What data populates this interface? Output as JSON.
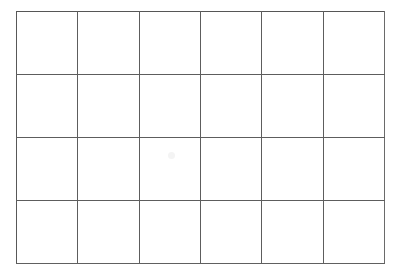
{
  "document": {
    "type": "empty-grid-table",
    "description": "Blank 6 column by 4 row grid / table with no content",
    "background_color": "#ffffff",
    "line_color": "#5d5d5d",
    "line_width_px": 1
  },
  "grid": {
    "columns": 6,
    "rows": 4,
    "total_cells": 24,
    "outer_left_px": 16,
    "outer_top_px": 11,
    "outer_width_px": 369,
    "outer_height_px": 253,
    "column_boundaries_px": [
      16,
      77,
      140,
      201,
      262,
      323,
      385
    ],
    "row_boundaries_px": [
      11,
      76,
      139,
      202,
      264
    ],
    "column_width_px": 61.5,
    "row_height_px": 63.25
  },
  "cells": [
    [
      "",
      "",
      "",
      "",
      "",
      ""
    ],
    [
      "",
      "",
      "",
      "",
      "",
      ""
    ],
    [
      "",
      "",
      "",
      "",
      "",
      ""
    ],
    [
      "",
      "",
      "",
      "",
      "",
      ""
    ]
  ]
}
